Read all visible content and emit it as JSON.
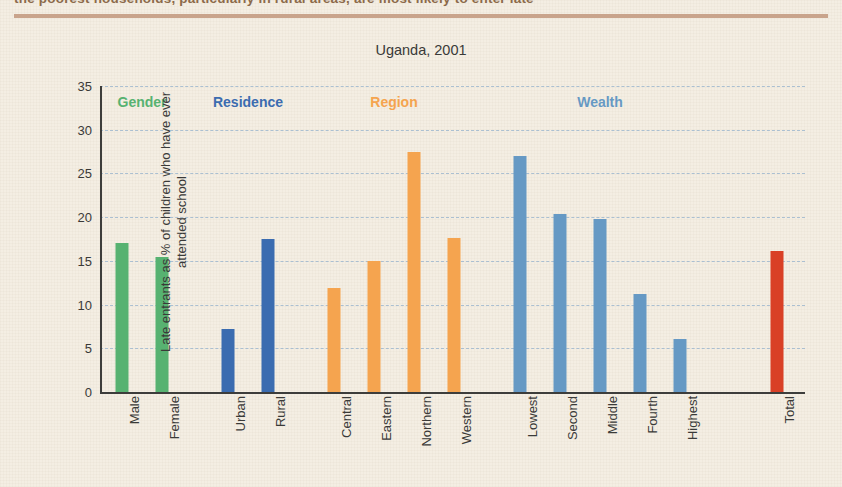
{
  "page": {
    "background_color": "#f4eee3",
    "top_rule_color": "#c9a48c",
    "top_cut_heading": "the poorest households, particularly in rural areas, are most likely to enter late"
  },
  "chart_data": {
    "type": "bar",
    "title": "Uganda, 2001",
    "xlabel": "",
    "ylabel": "Late entrants as % of children who have ever attended school",
    "ylim": [
      0,
      35
    ],
    "ytick_values": [
      0,
      5,
      10,
      15,
      20,
      25,
      30,
      35
    ],
    "ytick_labels": [
      "0",
      "5",
      "10",
      "15",
      "20",
      "25",
      "30",
      "35"
    ],
    "grid": true,
    "grid_color": "#9fb8cf",
    "legend": "none",
    "categories": [
      "Male",
      "Female",
      "Urban",
      "Rural",
      "Central",
      "Eastern",
      "Northern",
      "Western",
      "Lowest",
      "Second",
      "Middle",
      "Fourth",
      "Highest",
      "Total"
    ],
    "values": [
      17.0,
      15.4,
      7.2,
      17.5,
      11.9,
      15.0,
      27.4,
      17.6,
      27.0,
      20.4,
      19.8,
      11.2,
      6.1,
      16.1
    ],
    "bar_colors": [
      "#57b271",
      "#57b271",
      "#3b6cb0",
      "#3b6cb0",
      "#f5a44f",
      "#f5a44f",
      "#f5a44f",
      "#f5a44f",
      "#6699c4",
      "#6699c4",
      "#6699c4",
      "#6699c4",
      "#6699c4",
      "#d94026"
    ],
    "groups": [
      {
        "label": "Gender",
        "color": "#57b271",
        "members": [
          "Male",
          "Female"
        ]
      },
      {
        "label": "Residence",
        "color": "#3b6cb0",
        "members": [
          "Urban",
          "Rural"
        ]
      },
      {
        "label": "Region",
        "color": "#f5a44f",
        "members": [
          "Central",
          "Eastern",
          "Northern",
          "Western"
        ]
      },
      {
        "label": "Wealth",
        "color": "#6699c4",
        "members": [
          "Lowest",
          "Second",
          "Middle",
          "Fourth",
          "Highest"
        ]
      },
      {
        "label": "",
        "color": "#d94026",
        "members": [
          "Total"
        ]
      }
    ]
  }
}
